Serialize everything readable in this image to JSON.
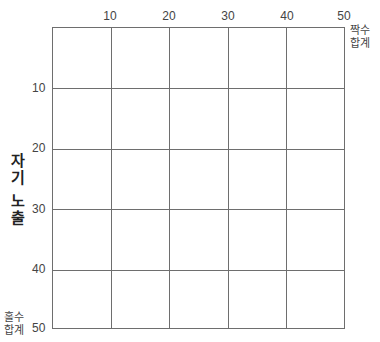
{
  "diagram": {
    "x_axis": {
      "ticks": [
        "10",
        "20",
        "30",
        "40",
        "50"
      ],
      "end_label_line1": "짝수",
      "end_label_line2": "합계"
    },
    "y_axis": {
      "ticks": [
        "10",
        "20",
        "30",
        "40",
        "50"
      ],
      "end_label_line1": "홀수",
      "end_label_line2": "합계",
      "title_chars_group1": [
        "자",
        "기"
      ],
      "title_chars_group2": [
        "노",
        "출"
      ]
    },
    "grid": {
      "columns": 5,
      "rows": 5,
      "line_color": "#6e6e6e"
    }
  }
}
